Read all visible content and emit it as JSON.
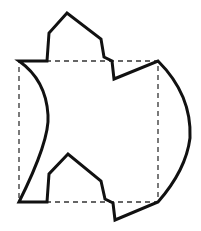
{
  "diagram": {
    "title": "",
    "colors": {
      "stroke": "#111111",
      "dashed": "#333333",
      "background": "#ffffff"
    },
    "square": {
      "x": 19,
      "y": 61,
      "width": 139,
      "height": 141,
      "style": "dashed"
    },
    "shape_path": "M19,61 L47,61 L49,33 L67,13 L101,39 L104,57 L112,61 L114,79 L158,61 Q192,95 190,138 Q186,170 158,202 L115,220 L113,203 L105,199 L101,181 L68,154 L49,174 L47,202 L19,202 Q50,140 48,115 Q46,80 19,61 Z"
  }
}
